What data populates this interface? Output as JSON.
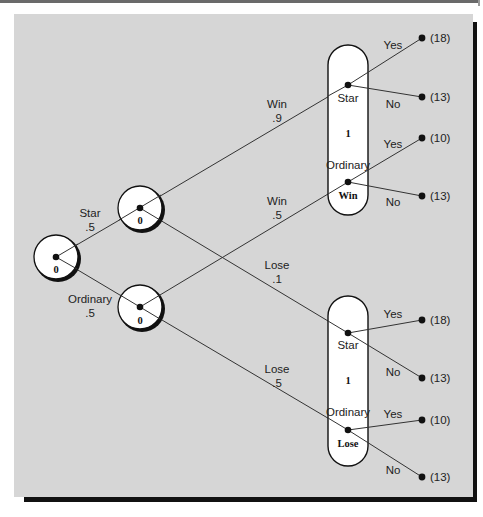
{
  "diagram": {
    "type": "decision-tree",
    "colors": {
      "panel_background": "#d6d6d6",
      "shadow": "#111111",
      "node_fill": "#ffffff",
      "line": "#333333"
    },
    "root_node": {
      "value": "0"
    },
    "first_branches": [
      {
        "label": "Star",
        "probability": ".5",
        "node_value": "0"
      },
      {
        "label": "Ordinary",
        "probability": ".5",
        "node_value": "0"
      }
    ],
    "outcome_groups": [
      {
        "name": "Win",
        "value": "1",
        "states": [
          "Star",
          "Ordinary"
        ],
        "incoming": [
          {
            "from": "Star",
            "label": "Win",
            "probability": ".9"
          },
          {
            "from": "Ordinary",
            "label": "Win",
            "probability": ".5"
          }
        ],
        "terminals": [
          {
            "state": "Star",
            "choice": "Yes",
            "payoff": "(18)"
          },
          {
            "state": "Star",
            "choice": "No",
            "payoff": "(13)"
          },
          {
            "state": "Ordinary",
            "choice": "Yes",
            "payoff": "(10)"
          },
          {
            "state": "Ordinary",
            "choice": "No",
            "payoff": "(13)"
          }
        ]
      },
      {
        "name": "Lose",
        "value": "1",
        "states": [
          "Star",
          "Ordinary"
        ],
        "incoming": [
          {
            "from": "Star",
            "label": "Lose",
            "probability": ".1"
          },
          {
            "from": "Ordinary",
            "label": "Lose",
            "probability": ".5"
          }
        ],
        "terminals": [
          {
            "state": "Star",
            "choice": "Yes",
            "payoff": "(18)"
          },
          {
            "state": "Star",
            "choice": "No",
            "payoff": "(13)"
          },
          {
            "state": "Ordinary",
            "choice": "Yes",
            "payoff": "(10)"
          },
          {
            "state": "Ordinary",
            "choice": "No",
            "payoff": "(13)"
          }
        ]
      }
    ]
  }
}
